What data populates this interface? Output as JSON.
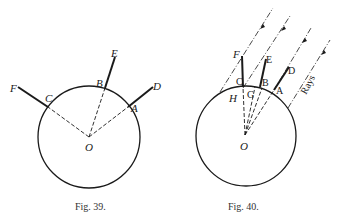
{
  "figures": [
    {
      "caption": "Fig. 39.",
      "labels": {
        "F": "F",
        "E": "E",
        "D": "D",
        "C": "C",
        "B": "B",
        "A": "A",
        "O": "O"
      }
    },
    {
      "caption": "Fig. 40.",
      "labels": {
        "F": "F",
        "E": "E",
        "D": "D",
        "C": "C",
        "B": "B",
        "A": "A",
        "G": "G",
        "H": "H",
        "O": "O",
        "rays": "Rays"
      }
    }
  ]
}
